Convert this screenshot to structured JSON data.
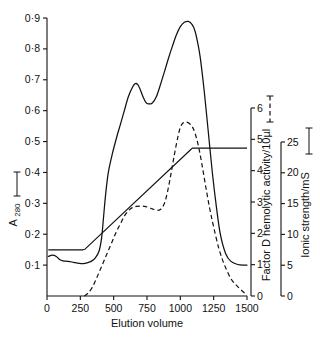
{
  "chart_data": {
    "type": "line",
    "title": "",
    "xlabel": "Elution volume",
    "xlim": [
      0,
      1500
    ],
    "xticks": [
      0,
      250,
      500,
      750,
      1000,
      1250,
      1500
    ],
    "xticklabels": [
      "0",
      "250",
      "500",
      "750",
      "1000",
      "1250",
      "1500"
    ],
    "grid": false,
    "legend_position": "axis-labels",
    "axes": [
      {
        "id": "a280",
        "side": "left",
        "label": "A 280",
        "label_sub": "280",
        "label_marker": "solid-line",
        "marker_text": "(—)",
        "lim": [
          0,
          0.9
        ],
        "ticks": [
          0.1,
          0.2,
          0.3,
          0.4,
          0.5,
          0.6,
          0.7,
          0.8,
          0.9
        ],
        "ticklabels": [
          "0·1",
          "0·2",
          "0·3",
          "0·4",
          "0·5",
          "0·6",
          "0·7",
          "0·8",
          "0·9"
        ]
      },
      {
        "id": "factor_d",
        "side": "right-inner",
        "label": "Factor D hemolytic activity/10µl",
        "label_marker": "dashed-line",
        "marker_text": "(---)",
        "lim": [
          0,
          6
        ],
        "ticks": [
          0,
          1,
          2,
          3,
          4,
          5,
          6
        ],
        "ticklabels": [
          "0",
          "1",
          "2",
          "3",
          "4",
          "5",
          "6"
        ]
      },
      {
        "id": "ionic_strength",
        "side": "right-outer",
        "label": "Ionic strength/mS",
        "label_marker": "solid-line",
        "marker_text": "(—)",
        "lim": [
          0,
          25
        ],
        "ticks": [
          0,
          5,
          10,
          15,
          20,
          25
        ],
        "ticklabels": [
          "0",
          "5",
          "10",
          "15",
          "20",
          "25"
        ]
      }
    ],
    "series": [
      {
        "name": "A 280",
        "axis": "a280",
        "style": "solid",
        "x": [
          10,
          40,
          70,
          95,
          120,
          160,
          200,
          240,
          270,
          300,
          330,
          360,
          390,
          410,
          425,
          440,
          460,
          490,
          520,
          550,
          580,
          610,
          640,
          660,
          680,
          700,
          720,
          740,
          760,
          790,
          820,
          850,
          880,
          910,
          940,
          970,
          1000,
          1030,
          1060,
          1090,
          1110,
          1130,
          1150,
          1180,
          1210,
          1240,
          1270,
          1300,
          1340,
          1380,
          1430,
          1480,
          1500
        ],
        "y": [
          0.128,
          0.132,
          0.128,
          0.118,
          0.114,
          0.112,
          0.109,
          0.106,
          0.105,
          0.107,
          0.112,
          0.122,
          0.145,
          0.19,
          0.26,
          0.33,
          0.4,
          0.46,
          0.51,
          0.555,
          0.6,
          0.645,
          0.675,
          0.687,
          0.685,
          0.668,
          0.645,
          0.628,
          0.622,
          0.625,
          0.645,
          0.683,
          0.725,
          0.768,
          0.808,
          0.845,
          0.872,
          0.886,
          0.889,
          0.878,
          0.858,
          0.82,
          0.77,
          0.66,
          0.53,
          0.4,
          0.29,
          0.2,
          0.137,
          0.112,
          0.102,
          0.1,
          0.1
        ]
      },
      {
        "name": "Factor D hemolytic activity/10µl",
        "axis": "factor_d",
        "style": "dashed",
        "x": [
          280,
          310,
          340,
          370,
          400,
          430,
          460,
          490,
          520,
          550,
          580,
          610,
          640,
          670,
          700,
          730,
          760,
          790,
          820,
          850,
          880,
          905,
          930,
          955,
          980,
          1000,
          1020,
          1045,
          1070,
          1090,
          1110,
          1135,
          1160,
          1190,
          1220,
          1250,
          1290,
          1330,
          1380,
          1430,
          1480,
          1500
        ],
        "y": [
          0.0,
          0.1,
          0.28,
          0.55,
          0.85,
          1.15,
          1.45,
          1.75,
          2.05,
          2.3,
          2.55,
          2.72,
          2.82,
          2.86,
          2.87,
          2.86,
          2.83,
          2.78,
          2.74,
          2.76,
          2.95,
          3.35,
          3.9,
          4.5,
          5.05,
          5.38,
          5.52,
          5.55,
          5.5,
          5.4,
          5.2,
          4.8,
          4.25,
          3.5,
          2.8,
          2.2,
          1.5,
          1.0,
          0.55,
          0.3,
          0.1,
          0.02
        ]
      },
      {
        "name": "Ionic strength/mS",
        "axis": "ionic_strength",
        "style": "solid-gradient",
        "x": [
          10,
          270,
          285,
          1075,
          1090,
          1500
        ],
        "y": [
          7.5,
          7.5,
          7.6,
          23.7,
          24.0,
          24.0
        ]
      }
    ]
  }
}
